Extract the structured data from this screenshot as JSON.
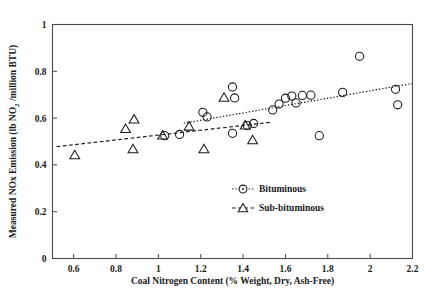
{
  "chart_data": {
    "type": "scatter",
    "title": "",
    "xlabel": "Coal Nitrogen Content (% Weight, Dry, Ash-Free)",
    "ylabel_parts": {
      "pre": "Measured NOx Emission (lb NO",
      "sub": "2",
      "post": " /million BTU)"
    },
    "ylabel": "Measured NOx Emission (lb NO2 /million BTU)",
    "xlim": [
      0.5,
      2.2
    ],
    "ylim": [
      0,
      1
    ],
    "xticks": [
      "0.6",
      "0.8",
      "1",
      "1.2",
      "1.4",
      "1.6",
      "1.8",
      "2",
      "2.2"
    ],
    "xtick_values": [
      0.6,
      0.8,
      1.0,
      1.2,
      1.4,
      1.6,
      1.8,
      2.0,
      2.2
    ],
    "yticks": [
      "0",
      "0.2",
      "0.4",
      "0.6",
      "0.8",
      "1"
    ],
    "ytick_values": [
      0,
      0.2,
      0.4,
      0.6,
      0.8,
      1.0
    ],
    "grid": false,
    "legend_position": "inside-lower-right",
    "frame": true,
    "series": [
      {
        "name": "Bituminous",
        "marker": "circle",
        "line_style": "dotted",
        "color": "#1a1a1a",
        "points": [
          [
            1.03,
            0.525
          ],
          [
            1.1,
            0.53
          ],
          [
            1.21,
            0.625
          ],
          [
            1.23,
            0.605
          ],
          [
            1.35,
            0.733
          ],
          [
            1.36,
            0.686
          ],
          [
            1.35,
            0.535
          ],
          [
            1.42,
            0.568
          ],
          [
            1.45,
            0.577
          ],
          [
            1.54,
            0.635
          ],
          [
            1.57,
            0.66
          ],
          [
            1.6,
            0.685
          ],
          [
            1.63,
            0.694
          ],
          [
            1.65,
            0.665
          ],
          [
            1.68,
            0.697
          ],
          [
            1.72,
            0.698
          ],
          [
            1.76,
            0.525
          ],
          [
            1.87,
            0.71
          ],
          [
            1.95,
            0.864
          ],
          [
            2.12,
            0.723
          ],
          [
            2.13,
            0.657
          ]
        ],
        "trend": {
          "x0": 1.12,
          "y0": 0.578,
          "x1": 2.2,
          "y1": 0.748
        }
      },
      {
        "name": "Sub-bituminous",
        "marker": "triangle",
        "line_style": "dashed",
        "color": "#1a1a1a",
        "points": [
          [
            0.605,
            0.443
          ],
          [
            0.845,
            0.555
          ],
          [
            0.885,
            0.595
          ],
          [
            0.88,
            0.468
          ],
          [
            1.02,
            0.527
          ],
          [
            1.145,
            0.565
          ],
          [
            1.215,
            0.468
          ],
          [
            1.31,
            0.688
          ],
          [
            1.41,
            0.57
          ],
          [
            1.445,
            0.507
          ]
        ],
        "trend": {
          "x0": 0.52,
          "y0": 0.478,
          "x1": 1.53,
          "y1": 0.582
        }
      }
    ]
  },
  "legend": {
    "items": [
      {
        "label": "Bituminous",
        "marker": "circle",
        "line_style": "dotted"
      },
      {
        "label": "Sub-bituminous",
        "marker": "triangle",
        "line_style": "dashed"
      }
    ]
  }
}
